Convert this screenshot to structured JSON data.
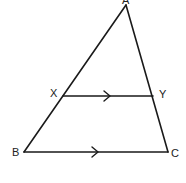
{
  "diagram": {
    "stroke_color": "#1a1a1a",
    "background": "#ffffff",
    "points": {
      "A": {
        "label": "A",
        "x": 126,
        "y": 5,
        "label_x": 122,
        "label_y": 4
      },
      "B": {
        "label": "B",
        "x": 24,
        "y": 152,
        "label_x": 12,
        "label_y": 156
      },
      "C": {
        "label": "C",
        "x": 168,
        "y": 152,
        "label_x": 171,
        "label_y": 157
      },
      "X": {
        "label": "X",
        "x": 63,
        "y": 96,
        "label_x": 50,
        "label_y": 97
      },
      "Y": {
        "label": "Y",
        "x": 153,
        "y": 96,
        "label_x": 159,
        "label_y": 98
      }
    },
    "segments": [
      {
        "from": "A",
        "to": "B"
      },
      {
        "from": "A",
        "to": "C"
      },
      {
        "from": "B",
        "to": "C",
        "parallel_mark": true
      },
      {
        "from": "X",
        "to": "Y",
        "parallel_mark": true
      }
    ],
    "relation": "XY ∥ BC"
  }
}
